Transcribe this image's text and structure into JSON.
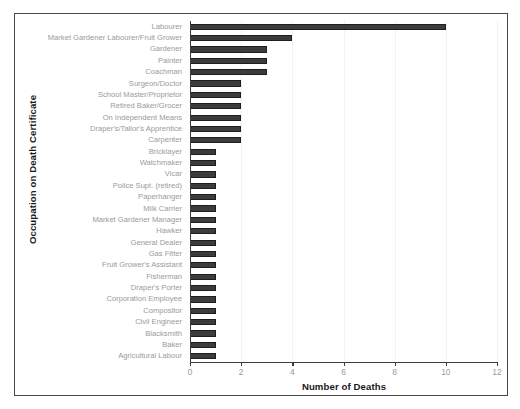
{
  "chart_data": {
    "type": "bar",
    "orientation": "horizontal",
    "title": "",
    "xlabel": "Number of Deaths",
    "ylabel": "Occupation on Death Certificate",
    "xlim": [
      0,
      12
    ],
    "xticks": [
      0,
      2,
      4,
      6,
      8,
      10,
      12
    ],
    "grid": true,
    "grid_axis": "x",
    "legend": null,
    "bar_color": "#3c3c3c",
    "bar_edge_color": "#1e1e1e",
    "categories": [
      "Labourer",
      "Market Gardener Labourer/Fruit Grower",
      "Gardener",
      "Painter",
      "Coachman",
      "Surgeon/Doctor",
      "School Master/Proprietor",
      "Retired Baker/Grocer",
      "On Independent Means",
      "Draper's/Tailor's Apprentice",
      "Carpenter",
      "Bricklayer",
      "Watchmaker",
      "Vicar",
      "Police Supt. (retired)",
      "Paperhanger",
      "Milk Carrier",
      "Market Gardener Manager",
      "Hawker",
      "General Dealer",
      "Gas Fitter",
      "Fruit Grower's Assistant",
      "Fisherman",
      "Draper's Porter",
      "Corporation Employee",
      "Compositor",
      "Civil Engineer",
      "Blacksmith",
      "Baker",
      "Agricultural Labour"
    ],
    "values": [
      10,
      4,
      3,
      3,
      3,
      2,
      2,
      2,
      2,
      2,
      2,
      1,
      1,
      1,
      1,
      1,
      1,
      1,
      1,
      1,
      1,
      1,
      1,
      1,
      1,
      1,
      1,
      1,
      1,
      1
    ]
  }
}
